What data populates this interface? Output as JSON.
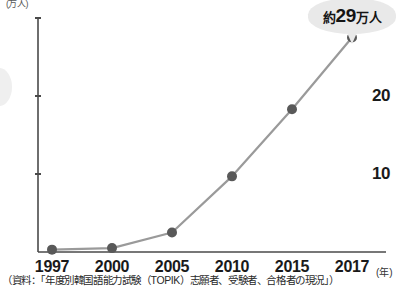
{
  "chart_data": {
    "type": "line",
    "title": "",
    "subtitle": "",
    "xlabel": "年",
    "ylabel": "万人",
    "categories": [
      "1997",
      "2000",
      "2005",
      "2010",
      "2015",
      "2017"
    ],
    "x": [
      1997,
      2000,
      2005,
      2010,
      2015,
      2017
    ],
    "values": [
      0.3,
      0.5,
      2.5,
      9.7,
      18.3,
      27.5
    ],
    "series": [
      {
        "name": "TOPIK志願者数",
        "values": [
          0.3,
          0.5,
          2.5,
          9.7,
          18.3,
          27.5
        ]
      }
    ],
    "ylim": [
      0,
      30
    ],
    "yticks": [
      10,
      20,
      30
    ],
    "ytick_labels": [
      "10",
      "20",
      "30"
    ],
    "xtick_labels": [
      "1997",
      "2000",
      "2005",
      "2010",
      "2015",
      "2017"
    ],
    "grid": false,
    "legend": false,
    "legend_position": "none",
    "annotations": [
      {
        "text": "約29万人",
        "prefix": "約",
        "number": "29",
        "suffix": "万人",
        "attached_to": "2017",
        "style": "speech-bubble"
      }
    ],
    "line_color": "#9a9a9a",
    "marker_color": "#595959",
    "axis_color": "#4a4a4a"
  },
  "axis": {
    "y_unit_label": "(万人)",
    "x_unit_label": "(年)"
  },
  "callout": {
    "prefix": "約",
    "number": "29",
    "suffix": "万人"
  },
  "footer": {
    "source_note": "（資料：「年度別韓国語能力試験（TOPIK）志願者、受験者、合格者の現況」）"
  },
  "colors": {
    "line": "#9a9a9a",
    "marker": "#595959",
    "axis": "#4a4a4a",
    "bubble": "#e9e9e9",
    "text": "#1a1a1a"
  }
}
